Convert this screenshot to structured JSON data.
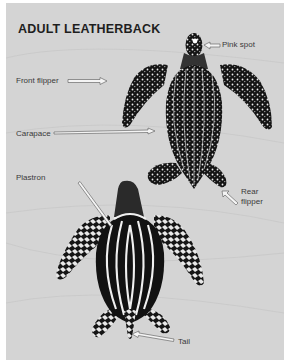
{
  "title": "ADULT LEATHERBACK",
  "labels": {
    "pink_spot": "Pink spot",
    "front_flipper": "Front flipper",
    "carapace": "Carapace",
    "plastron": "Plastron",
    "rear_flipper_line1": "Rear",
    "rear_flipper_line2": "flipper",
    "tail": "Tail"
  },
  "views": [
    {
      "name": "dorsal view",
      "parts": [
        "Pink spot",
        "Front flipper",
        "Carapace",
        "Rear flipper"
      ]
    },
    {
      "name": "ventral view",
      "parts": [
        "Plastron",
        "Tail"
      ]
    }
  ],
  "colors": {
    "background": "#d4d4d4",
    "margin": "#ffffff",
    "turtle": "#111111",
    "speckle": "#f2f2f2",
    "text": "#3a3a3a",
    "title": "#1e1e1e"
  }
}
